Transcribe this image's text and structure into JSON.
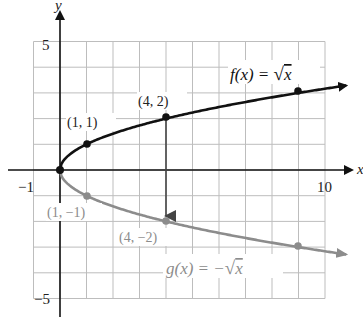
{
  "axes": {
    "x_label": "x",
    "y_label": "y",
    "x_min": -1,
    "x_max": 10,
    "y_min": -5,
    "y_max": 5,
    "tick_labels": {
      "x_neg": "−1",
      "x_pos": "10",
      "y_pos": "5",
      "y_neg": "−5"
    }
  },
  "colors": {
    "f_curve": "#111111",
    "g_curve": "#8c8c8c",
    "grid": "#bdbdbd",
    "axis": "#111111",
    "arrow": "#444444"
  },
  "f": {
    "label": "f(x) = √x",
    "label_prefix": "f(x) = ",
    "label_radicand": "x",
    "points": [
      {
        "x": 1,
        "y": 1,
        "label": "(1, 1)"
      },
      {
        "x": 4,
        "y": 2,
        "label": "(4, 2)"
      },
      {
        "x": 9,
        "y": 3,
        "label": ""
      }
    ]
  },
  "g": {
    "label": "g(x) = −√x",
    "label_prefix": "g(x) = −",
    "label_radicand": "x",
    "points": [
      {
        "x": 1,
        "y": -1,
        "label": "(1, −1)"
      },
      {
        "x": 4,
        "y": -2,
        "label": "(4, −2)"
      },
      {
        "x": 9,
        "y": -3,
        "label": ""
      }
    ]
  },
  "reflection_arrow": {
    "from": [
      4,
      2
    ],
    "to": [
      4,
      -2
    ]
  },
  "chart_data": {
    "type": "line",
    "title": "",
    "xlabel": "x",
    "ylabel": "y",
    "xlim": [
      -1,
      10
    ],
    "ylim": [
      -5,
      5
    ],
    "grid": true,
    "series": [
      {
        "name": "f(x) = √x",
        "x": [
          0,
          1,
          4,
          9
        ],
        "y": [
          0,
          1,
          2,
          3
        ]
      },
      {
        "name": "g(x) = −√x",
        "x": [
          0,
          1,
          4,
          9
        ],
        "y": [
          0,
          -1,
          -2,
          -3
        ]
      }
    ],
    "annotations": [
      "(1, 1)",
      "(4, 2)",
      "(1, −1)",
      "(4, −2)"
    ]
  }
}
